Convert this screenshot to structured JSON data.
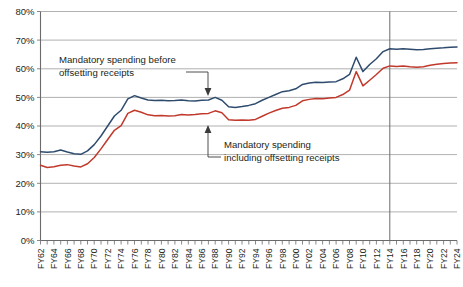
{
  "chart_data": {
    "type": "line",
    "title": "",
    "subtitle": "",
    "xlabel": "",
    "ylabel": "",
    "ylim": [
      0,
      80
    ],
    "ytick_labels": [
      "0%",
      "10%",
      "20%",
      "30%",
      "40%",
      "50%",
      "60%",
      "70%",
      "80%"
    ],
    "ytick_values": [
      0,
      10,
      20,
      30,
      40,
      50,
      60,
      70,
      80
    ],
    "grid": true,
    "legend_position": "none",
    "x": [
      "FY62",
      "FY63",
      "FY64",
      "FY65",
      "FY66",
      "FY67",
      "FY68",
      "FY69",
      "FY70",
      "FY71",
      "FY72",
      "FY73",
      "FY74",
      "FY75",
      "FY76",
      "FY77",
      "FY78",
      "FY79",
      "FY80",
      "FY81",
      "FY82",
      "FY83",
      "FY84",
      "FY85",
      "FY86",
      "FY87",
      "FY88",
      "FY89",
      "FY90",
      "FY91",
      "FY92",
      "FY93",
      "FY94",
      "FY95",
      "FY96",
      "FY97",
      "FY98",
      "FY99",
      "FY00",
      "FY01",
      "FY02",
      "FY03",
      "FY04",
      "FY05",
      "FY06",
      "FY07",
      "FY08",
      "FY09",
      "FY10",
      "FY11",
      "FY12",
      "FY13",
      "FY14",
      "FY15",
      "FY16",
      "FY17",
      "FY18",
      "FY19",
      "FY20",
      "FY21",
      "FY22",
      "FY23",
      "FY24"
    ],
    "xtick_labels": [
      "FY62",
      "FY64",
      "FY66",
      "FY68",
      "FY70",
      "FY72",
      "FY74",
      "FY76",
      "FY78",
      "FY80",
      "FY82",
      "FY84",
      "FY86",
      "FY88",
      "FY90",
      "FY92",
      "FY94",
      "FY96",
      "FY98",
      "FY00",
      "FY02",
      "FY04",
      "FY06",
      "FY08",
      "FY10",
      "FY12",
      "FY14",
      "FY16",
      "FY18",
      "FY20",
      "FY22",
      "FY24"
    ],
    "series": [
      {
        "name": "Mandatory spending before offsetting receipts",
        "color": "#2e4b6e",
        "values": [
          31.0,
          30.8,
          31.0,
          31.6,
          30.9,
          30.3,
          30.1,
          31.3,
          33.5,
          36.5,
          40.0,
          43.5,
          45.5,
          49.5,
          50.6,
          49.8,
          49.1,
          48.9,
          49.0,
          48.8,
          48.9,
          49.1,
          48.8,
          48.7,
          49.0,
          49.1,
          50.0,
          49.0,
          46.7,
          46.5,
          46.8,
          47.2,
          47.8,
          49.0,
          50.0,
          51.0,
          52.0,
          52.3,
          53.0,
          54.5,
          55.0,
          55.3,
          55.2,
          55.4,
          55.5,
          56.5,
          58.0,
          64.0,
          59.0,
          61.5,
          63.5,
          66.0,
          67.0,
          66.8,
          67.0,
          66.8,
          66.6,
          66.7,
          67.0,
          67.2,
          67.3,
          67.5,
          67.6
        ],
        "marker": "none"
      },
      {
        "name": "Mandatory spending including offsetting receipts",
        "color": "#c0392b",
        "values": [
          26.3,
          25.5,
          25.8,
          26.3,
          26.5,
          26.0,
          25.7,
          26.8,
          29.0,
          32.0,
          35.3,
          38.5,
          40.1,
          44.4,
          45.5,
          44.8,
          43.9,
          43.6,
          43.7,
          43.5,
          43.6,
          44.0,
          43.8,
          44.0,
          44.3,
          44.4,
          45.3,
          44.6,
          42.2,
          42.0,
          42.1,
          42.0,
          42.3,
          43.4,
          44.5,
          45.4,
          46.2,
          46.5,
          47.2,
          48.8,
          49.3,
          49.6,
          49.5,
          49.8,
          50.0,
          51.0,
          52.5,
          59.0,
          54.0,
          56.0,
          58.0,
          60.2,
          61.0,
          60.8,
          61.0,
          60.7,
          60.5,
          60.7,
          61.2,
          61.6,
          61.8,
          62.0,
          62.1
        ],
        "marker": "none"
      }
    ],
    "annotations": [
      {
        "id": "annotation-before-receipts",
        "text_line1": "Mandatory spending before",
        "text_line2": "offsetting receipts",
        "points_to_series": "Mandatory spending before offsetting receipts",
        "arrow_direction": "down"
      },
      {
        "id": "annotation-including-receipts",
        "text_line1": "Mandatory spending",
        "text_line2": "including offsetting receipts",
        "points_to_series": "Mandatory spending including offsetting receipts",
        "arrow_direction": "up"
      }
    ],
    "reference_line": {
      "id": "projection-divider",
      "at_x": "FY14",
      "label": ""
    },
    "colors": {
      "before_receipts": "#2e4b6e",
      "including_receipts": "#c0392b",
      "grid": "#9d9d9d",
      "axis": "#6b6b6b",
      "text": "#231f20",
      "background": "#ffffff"
    }
  }
}
